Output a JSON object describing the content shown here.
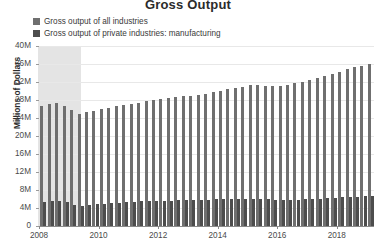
{
  "chart_data": {
    "type": "bar",
    "title": "Gross Output",
    "xlabel": "",
    "ylabel": "Millions of Dollars",
    "ylim": [
      0,
      40000000
    ],
    "ytick_labels": [
      "0",
      "4M",
      "8M",
      "12M",
      "16M",
      "20M",
      "24M",
      "28M",
      "32M",
      "36M",
      "40M"
    ],
    "ytick_values": [
      0,
      4000000,
      8000000,
      12000000,
      16000000,
      20000000,
      24000000,
      28000000,
      32000000,
      36000000,
      40000000
    ],
    "xtick_labels": [
      "2008",
      "2010",
      "2012",
      "2014",
      "2016",
      "2018"
    ],
    "xtick_values": [
      2008,
      2010,
      2012,
      2014,
      2016,
      2018
    ],
    "grid": true,
    "legend_position": "top-left",
    "recession_band": {
      "start": 2007.95,
      "end": 2009.4,
      "color": "#e4e4e4",
      "label": ""
    },
    "series": [
      {
        "name": "Gross output of all industries",
        "color": "#6f6f6f",
        "values": [
          26600000,
          27100000,
          27400000,
          26600000,
          25700000,
          25000000,
          25300000,
          25500000,
          25900000,
          26300000,
          26600000,
          26900000,
          27100000,
          27400000,
          27700000,
          28100000,
          28300000,
          28500000,
          28700000,
          28900000,
          29000000,
          29200000,
          29400000,
          29700000,
          30000000,
          30400000,
          30700000,
          31000000,
          31300000,
          31400000,
          31200000,
          31100000,
          31200000,
          31400000,
          31700000,
          32000000,
          32400000,
          32900000,
          33400000,
          33800000,
          34300000,
          34900000,
          35300000,
          35600000,
          36000000
        ]
      },
      {
        "name": "Gross output of private industries: manufacturing",
        "color": "#4d4d4d",
        "values": [
          5300000,
          5450000,
          5600000,
          5250000,
          4750000,
          4500000,
          4650000,
          4800000,
          4950000,
          5100000,
          5200000,
          5250000,
          5350000,
          5450000,
          5500000,
          5550000,
          5600000,
          5650000,
          5700000,
          5750000,
          5750000,
          5800000,
          5850000,
          5900000,
          5950000,
          6000000,
          6050000,
          6100000,
          6100000,
          6050000,
          5950000,
          5850000,
          5800000,
          5800000,
          5850000,
          5900000,
          5950000,
          6050000,
          6150000,
          6250000,
          6350000,
          6450000,
          6550000,
          6600000,
          6650000
        ]
      }
    ],
    "x_start": 2008.0,
    "x_step": 0.25,
    "n_points": 45
  },
  "legend": {
    "items": [
      {
        "label": "Gross output of all industries",
        "color": "#6f6f6f"
      },
      {
        "label": "Gross output of private industries: manufacturing",
        "color": "#4d4d4d"
      }
    ]
  },
  "colors": {
    "plot_background": "#ffffff",
    "gridline": "#e8e8e8",
    "axis": "#8a8a8a",
    "text": "#3b3b3b",
    "recession": "#e4e4e4"
  }
}
